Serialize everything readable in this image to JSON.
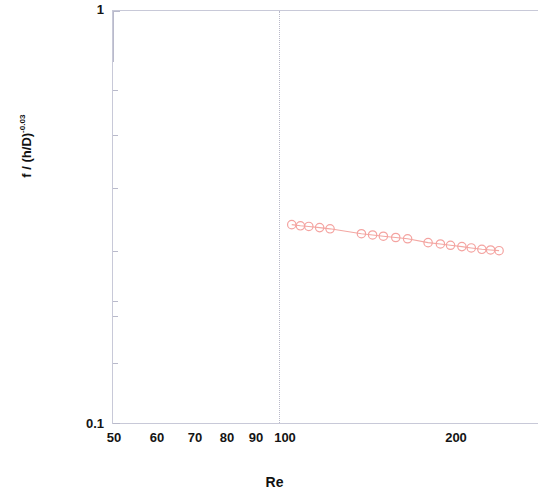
{
  "chart_data": {
    "type": "scatter",
    "title": "",
    "xlabel": "Re",
    "ylabel": "f / (h/D)",
    "ylabel_exponent": "-0.03",
    "xscale": "log",
    "yscale": "log",
    "xlim": [
      50,
      230
    ],
    "ylim": [
      0.1,
      1
    ],
    "grid": "vertical-dotted-at-100",
    "legend": "none",
    "x_ticklabels": [
      "50",
      "60",
      "70",
      "80",
      "90",
      "100",
      "200"
    ],
    "x_tickvalues": [
      50,
      60,
      70,
      80,
      90,
      100,
      200
    ],
    "y_ticklabels": [
      "1",
      "0.1"
    ],
    "y_tickvalues": [
      1,
      0.1
    ],
    "series": [
      {
        "name": "f / (h/D)^-0.03 vs Re",
        "marker": "open-circle",
        "color": "#f4a3a0",
        "line_color": "#f3a7a2",
        "x": [
          95,
          98,
          101,
          105,
          109,
          122,
          127,
          132,
          138,
          144,
          155,
          162,
          168,
          175,
          181,
          188,
          194,
          200
        ],
        "y": [
          0.303,
          0.301,
          0.3,
          0.298,
          0.296,
          0.288,
          0.286,
          0.284,
          0.282,
          0.28,
          0.274,
          0.272,
          0.27,
          0.268,
          0.266,
          0.264,
          0.263,
          0.262
        ]
      }
    ]
  },
  "axis_titles": {
    "x": "Re",
    "y_base": "f / (h/D)",
    "y_sup": "-0.03"
  },
  "colors": {
    "marker": "#f4a3a0",
    "line": "#f3a7a2",
    "axis": "#c8c9d8",
    "text": "#141414"
  }
}
